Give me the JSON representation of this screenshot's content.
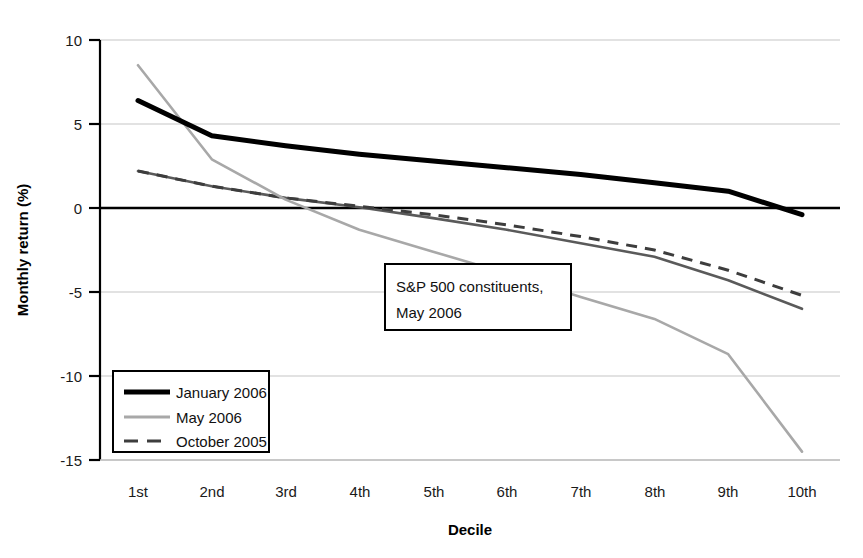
{
  "chart_data": {
    "type": "line",
    "title": "",
    "xlabel": "Decile",
    "ylabel": "Monthly return (%)",
    "categories": [
      "1st",
      "2nd",
      "3rd",
      "4th",
      "5th",
      "6th",
      "7th",
      "8th",
      "9th",
      "10th"
    ],
    "ylim": [
      -15,
      10
    ],
    "yticks": [
      10,
      5,
      0,
      -5,
      -10,
      -15
    ],
    "ytick_labels": [
      "10",
      "5",
      "0",
      "-5",
      "-10",
      "-15"
    ],
    "grid": "horizontal",
    "legend_position": "bottom-left",
    "annotations": [
      {
        "name": "sample-annotation",
        "line1": "S&P 500 constituents,",
        "line2": "May 2006"
      }
    ],
    "series": [
      {
        "name": "January 2006",
        "style": "solid-thick",
        "color": "#000000",
        "values": [
          6.4,
          4.3,
          3.7,
          3.2,
          2.8,
          2.4,
          2.0,
          1.5,
          1.0,
          -0.4
        ]
      },
      {
        "name": "May 2006",
        "style": "solid-thin",
        "color": "#a8a8a8",
        "values": [
          8.5,
          2.9,
          0.5,
          -1.3,
          -2.6,
          -3.9,
          -5.3,
          -6.6,
          -8.7,
          -14.5
        ]
      },
      {
        "name": "October 2005",
        "style": "dashed",
        "color": "#4d4d4d",
        "values": [
          2.2,
          1.3,
          0.6,
          0.1,
          -0.4,
          -1.0,
          -1.7,
          -2.5,
          -3.7,
          -5.2
        ]
      },
      {
        "name": "",
        "style": "solid-medium",
        "color": "#5a5a5a",
        "values": [
          2.2,
          1.3,
          0.6,
          0.05,
          -0.6,
          -1.3,
          -2.1,
          -2.9,
          -4.3,
          -6.0
        ]
      }
    ]
  },
  "legend": {
    "items": [
      {
        "label": "January 2006",
        "swatch": "solid-thick"
      },
      {
        "label": "May 2006",
        "swatch": "solid-thin"
      },
      {
        "label": "October 2005",
        "swatch": "dashed"
      }
    ]
  },
  "axes": {
    "y_title": "Monthly return (%)",
    "x_title": "Decile",
    "y_tick_10": "10",
    "y_tick_5": "5",
    "y_tick_0": "0",
    "y_tick_m5": "-5",
    "y_tick_m10": "-10",
    "y_tick_m15": "-15",
    "x_tick_1": "1st",
    "x_tick_2": "2nd",
    "x_tick_3": "3rd",
    "x_tick_4": "4th",
    "x_tick_5": "5th",
    "x_tick_6": "6th",
    "x_tick_7": "7th",
    "x_tick_8": "8th",
    "x_tick_9": "9th",
    "x_tick_10": "10th"
  },
  "annotation": {
    "line1": "S&P 500 constituents,",
    "line2": "May 2006"
  },
  "colors": {
    "series_january": "#000000",
    "series_may": "#a8a8a8",
    "series_october": "#4d4d4d",
    "series_fourth": "#5a5a5a",
    "grid": "#d9d9d9",
    "axis": "#000000"
  }
}
